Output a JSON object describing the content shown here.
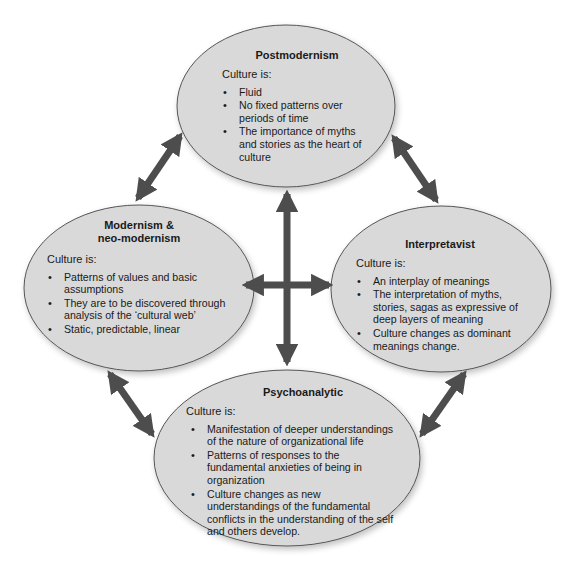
{
  "colors": {
    "ellipse_fill": "#d9d9d9",
    "ellipse_stroke": "#555555",
    "arrow": "#4d4d4d"
  },
  "nodes": {
    "top": {
      "title": "Postmodernism",
      "lead": "Culture is:",
      "items": [
        "Fluid",
        "No fixed patterns over periods of time",
        "The importance of myths and stories as the heart of culture"
      ]
    },
    "left": {
      "title_line1": "Modernism &",
      "title_line2": "neo-modernism",
      "lead": "Culture is:",
      "items": [
        "Patterns of values and basic assumptions",
        "They are to be discovered through analysis of the ‘cultural web’",
        "Static, predictable, linear"
      ]
    },
    "right": {
      "title": "Interpretavist",
      "lead": "Culture is:",
      "items": [
        "An interplay of meanings",
        "The interpretation of myths, stories, sagas as expressive of deep layers of meaning",
        "Culture changes as dominant meanings change."
      ]
    },
    "bottom": {
      "title": "Psychoanalytic",
      "lead": "Culture is:",
      "items": [
        "Manifestation of deeper understandings of the nature of organizational life",
        "Patterns of responses to the fundamental anxieties of being in organization",
        "Culture changes as new understandings of the fundamental conflicts in the understanding of the self and others develop."
      ]
    }
  },
  "connections": [
    {
      "from": "top",
      "to": "left",
      "type": "double-arrow"
    },
    {
      "from": "top",
      "to": "right",
      "type": "double-arrow"
    },
    {
      "from": "left",
      "to": "bottom",
      "type": "double-arrow"
    },
    {
      "from": "right",
      "to": "bottom",
      "type": "double-arrow"
    },
    {
      "from": "top",
      "to": "bottom",
      "type": "double-arrow",
      "center_cross": true
    },
    {
      "from": "left",
      "to": "right",
      "type": "double-arrow",
      "center_cross": true
    }
  ]
}
